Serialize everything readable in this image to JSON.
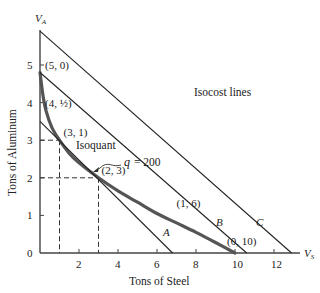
{
  "chart_data": {
    "type": "line",
    "title": "",
    "xlabel": "Tons of Steel",
    "ylabel": "Tons of Aluminum",
    "x_axis_symbol": "V",
    "x_axis_symbol_sub": "S",
    "y_axis_symbol": "V",
    "y_axis_symbol_sub": "A",
    "xlim": [
      0,
      13.5
    ],
    "ylim": [
      0,
      6
    ],
    "x_ticks": [
      2,
      4,
      6,
      8,
      10,
      12
    ],
    "y_ticks": [
      0,
      1,
      2,
      3,
      4,
      5
    ],
    "grid": false,
    "legend": null,
    "series": [
      {
        "name": "Isoquant q = 200",
        "kind": "curve",
        "color": "#555555",
        "points": [
          [
            0,
            4.8
          ],
          [
            0.15,
            4.2
          ],
          [
            0.3,
            3.8
          ],
          [
            0.6,
            3.35
          ],
          [
            1,
            3
          ],
          [
            1.5,
            2.65
          ],
          [
            2,
            2.4
          ],
          [
            3,
            2
          ],
          [
            4,
            1.65
          ],
          [
            5,
            1.35
          ],
          [
            6,
            1.05
          ],
          [
            7,
            0.8
          ],
          [
            8,
            0.55
          ],
          [
            9,
            0.28
          ],
          [
            10,
            0
          ]
        ]
      },
      {
        "name": "A",
        "kind": "isocost",
        "color": "#222222",
        "points": [
          [
            0,
            3.5
          ],
          [
            6.8,
            0
          ]
        ]
      },
      {
        "name": "B",
        "kind": "isocost",
        "color": "#222222",
        "points": [
          [
            0,
            4.8
          ],
          [
            10.6,
            0
          ]
        ]
      },
      {
        "name": "C",
        "kind": "isocost",
        "color": "#222222",
        "points": [
          [
            0,
            5.9
          ],
          [
            12.9,
            0
          ]
        ]
      }
    ],
    "labeled_points": [
      {
        "label": "(5, 0)",
        "x": 0,
        "y": 5
      },
      {
        "label": "(4, ½)",
        "x": 0,
        "y": 4
      },
      {
        "label": "(3, 1)",
        "x": 1,
        "y": 3
      },
      {
        "label": "(2, 3)",
        "x": 3,
        "y": 2
      },
      {
        "label": "(1, 6)",
        "x": 6.9,
        "y": 0.95
      },
      {
        "label": "(0, 10)",
        "x": 10,
        "y": 0
      }
    ],
    "dashed_guides": [
      {
        "x": 1,
        "y": 3
      },
      {
        "x": 3,
        "y": 2
      }
    ],
    "annotations": [
      {
        "text": "Isocost lines",
        "x": 7.9,
        "y": 4.3
      },
      {
        "text": "Isoquant",
        "x": 1.6,
        "y": 2.85
      },
      {
        "text": "q = 200",
        "x": 4.1,
        "y": 2.45
      },
      {
        "text": "A",
        "x": 6.4,
        "y": 0.35
      },
      {
        "text": "B",
        "x": 9.2,
        "y": 0.6
      },
      {
        "text": "C",
        "x": 11.1,
        "y": 0.95
      }
    ]
  },
  "labels": {
    "x_title": "Tons of Steel",
    "y_title": "Tons of Aluminum",
    "isocost": "Isocost lines",
    "isoquant": "Isoquant",
    "q": "q",
    "q_value": "= 200",
    "A": "A",
    "B": "B",
    "C": "C",
    "origin": "0"
  }
}
